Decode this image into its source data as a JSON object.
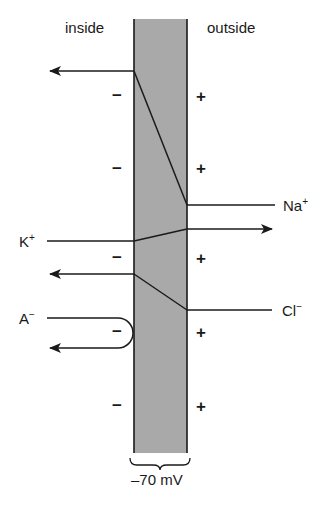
{
  "labels": {
    "inside": "inside",
    "outside": "outside",
    "potential": "–70 mV"
  },
  "ions": {
    "na": {
      "base": "Na",
      "charge": "+"
    },
    "k": {
      "base": "K",
      "charge": "+"
    },
    "cl": {
      "base": "Cl",
      "charge": "−"
    },
    "a": {
      "base": "A",
      "charge": "−"
    }
  },
  "signs": {
    "inside": [
      "−",
      "−",
      "−",
      "−",
      "−"
    ],
    "outside": [
      "+",
      "+",
      "+",
      "+",
      "+"
    ]
  },
  "colors": {
    "membrane_fill": "#a9a9a9",
    "stroke": "#1a1a1a",
    "background": "#ffffff"
  }
}
